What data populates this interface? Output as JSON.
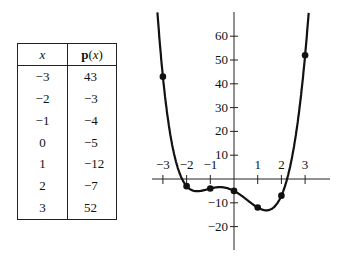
{
  "table": {
    "headers": [
      "x",
      "p(x)"
    ],
    "rows": [
      {
        "x": "−3",
        "p": "43"
      },
      {
        "x": "−2",
        "p": "−3"
      },
      {
        "x": "−1",
        "p": "−4"
      },
      {
        "x": "0",
        "p": "−5"
      },
      {
        "x": "1",
        "p": "−12"
      },
      {
        "x": "2",
        "p": "−7"
      },
      {
        "x": "3",
        "p": "52"
      }
    ]
  },
  "chart_data": {
    "type": "line",
    "title": "",
    "xlabel": "",
    "ylabel": "",
    "x": [
      -3,
      -2,
      -1,
      0,
      1,
      2,
      3
    ],
    "series": [
      {
        "name": "p(x)",
        "values": [
          43,
          -3,
          -4,
          -5,
          -12,
          -7,
          52
        ],
        "markers": true
      }
    ],
    "x_ticks": [
      "−3",
      "−2",
      "−1",
      "1",
      "2",
      "3"
    ],
    "y_ticks": [
      "60",
      "50",
      "40",
      "30",
      "20",
      "10",
      "−10",
      "−20"
    ],
    "xlim": [
      -3.3,
      3.6
    ],
    "ylim": [
      -30,
      70
    ],
    "grid": false,
    "legend": "none",
    "line_color": "#111111"
  }
}
